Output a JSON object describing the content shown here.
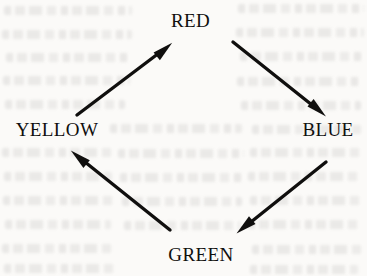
{
  "diagram": {
    "type": "directed-cycle",
    "title": "",
    "orientation": "clockwise",
    "shape": "diamond",
    "background_color": "#fbfaf8",
    "ink_color": "#100f0e",
    "nodes": [
      {
        "id": "red",
        "label": "RED",
        "position": "top",
        "x": 190,
        "y": 21
      },
      {
        "id": "blue",
        "label": "BLUE",
        "position": "right",
        "x": 328,
        "y": 130
      },
      {
        "id": "green",
        "label": "GREEN",
        "position": "bottom",
        "x": 201,
        "y": 255
      },
      {
        "id": "yellow",
        "label": "YELLOW",
        "position": "left",
        "x": 57,
        "y": 130
      }
    ],
    "edges": [
      {
        "id": "red-to-blue",
        "from": "RED",
        "to": "BLUE",
        "direction": "down-right",
        "tail": {
          "x": 233,
          "y": 42
        },
        "tip": {
          "x": 325,
          "y": 115
        }
      },
      {
        "id": "blue-to-green",
        "from": "BLUE",
        "to": "GREEN",
        "direction": "down-left",
        "tail": {
          "x": 326,
          "y": 162
        },
        "tip": {
          "x": 237,
          "y": 233
        }
      },
      {
        "id": "green-to-yellow",
        "from": "GREEN",
        "to": "YELLOW",
        "direction": "up-left",
        "tail": {
          "x": 170,
          "y": 230
        },
        "tip": {
          "x": 71,
          "y": 151
        }
      },
      {
        "id": "yellow-to-red",
        "from": "YELLOW",
        "to": "RED",
        "direction": "up-right",
        "tail": {
          "x": 77,
          "y": 115
        },
        "tip": {
          "x": 172,
          "y": 43
        }
      }
    ],
    "cycle_sequence": "RED → BLUE → GREEN → YELLOW → RED"
  }
}
